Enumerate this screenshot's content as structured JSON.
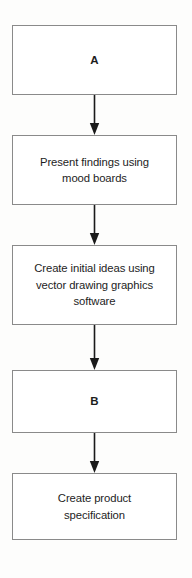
{
  "diagram": {
    "orientation": "vertical-top-to-bottom",
    "colors": {
      "page_background": "#fdfdfc",
      "node_fill": "#ffffff",
      "node_border": "#8a8a8a",
      "text": "#1d1d1d",
      "connector": "#1a1a1a"
    },
    "nodes": [
      {
        "id": "a",
        "label": "A",
        "kind": "placeholder",
        "order": 1
      },
      {
        "id": "present",
        "label": "Present findings using\nmood boards",
        "kind": "process",
        "order": 2
      },
      {
        "id": "create",
        "label": "Create initial ideas using\nvector drawing graphics\nsoftware",
        "kind": "process",
        "order": 3
      },
      {
        "id": "b",
        "label": "B",
        "kind": "placeholder",
        "order": 4
      },
      {
        "id": "spec",
        "label": "Create product\nspecification",
        "kind": "process",
        "order": 5
      }
    ],
    "connectors": [
      {
        "id": "c1",
        "from": "a",
        "to": "present",
        "arrow": "down-arrow-icon"
      },
      {
        "id": "c2",
        "from": "present",
        "to": "create",
        "arrow": "down-arrow-icon"
      },
      {
        "id": "c3",
        "from": "create",
        "to": "b",
        "arrow": "down-arrow-icon"
      },
      {
        "id": "c4",
        "from": "b",
        "to": "spec",
        "arrow": "down-arrow-icon"
      }
    ]
  }
}
